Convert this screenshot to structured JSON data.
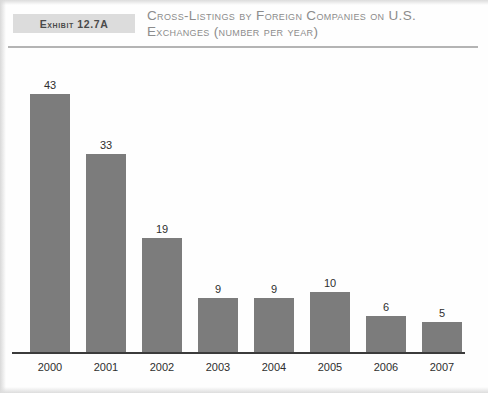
{
  "header": {
    "exhibit_label": "Exhibit 12.7A",
    "title": "Cross-Listings by Foreign Companies on U.S. Exchanges (number per year)"
  },
  "colors": {
    "bar_fill": "#7c7c7c",
    "badge_background": "#dcdcdc",
    "title_text": "#8c8c8c",
    "axis_line": "#3b3b3b",
    "rule": "#b4b4b4"
  },
  "chart_data": {
    "type": "bar",
    "title": "Cross-Listings by Foreign Companies on U.S. Exchanges (number per year)",
    "categories": [
      "2000",
      "2001",
      "2002",
      "2003",
      "2004",
      "2005",
      "2006",
      "2007"
    ],
    "values": [
      43,
      33,
      19,
      9,
      9,
      10,
      6,
      5
    ],
    "xlabel": "",
    "ylabel": "",
    "ylim": [
      0,
      47
    ],
    "grid": false,
    "legend": false,
    "data_labels": true,
    "series": [
      {
        "name": "Cross-listings",
        "values": [
          43,
          33,
          19,
          9,
          9,
          10,
          6,
          5
        ]
      }
    ]
  }
}
